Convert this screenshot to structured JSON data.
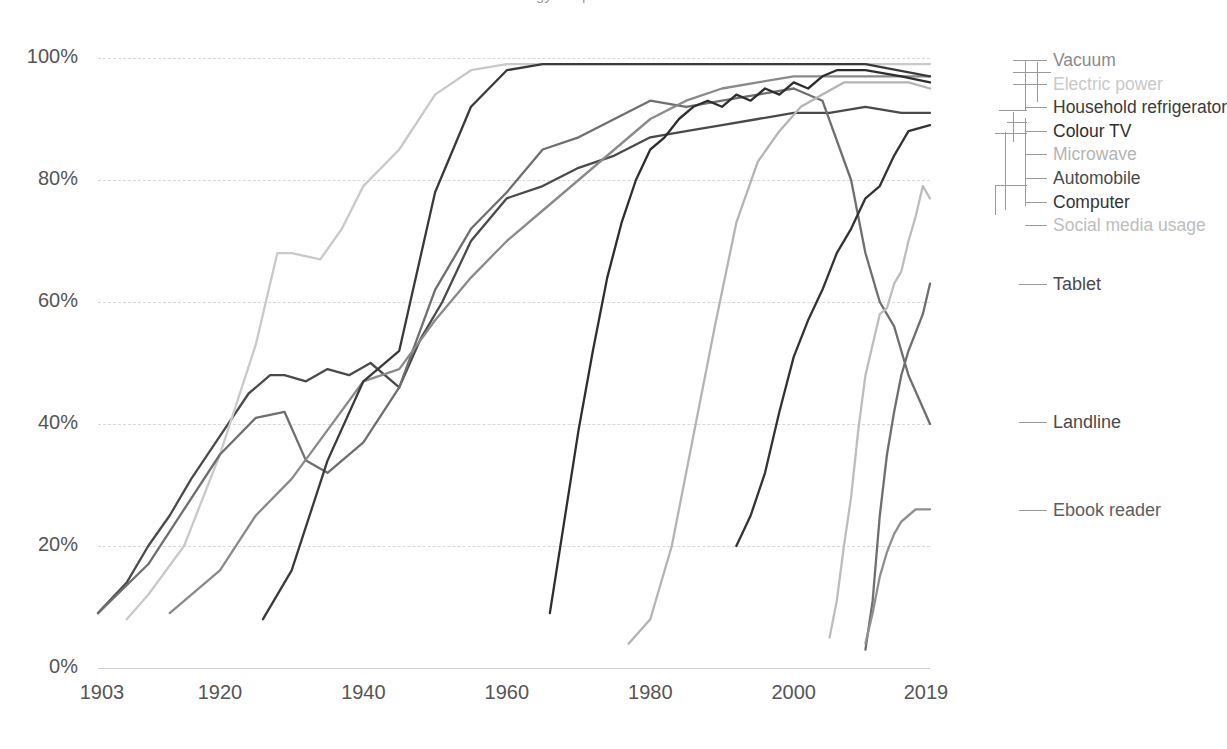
{
  "title": "Technology adoption in US households",
  "axes": {
    "y_ticks": [
      "100%",
      "80%",
      "60%",
      "40%",
      "20%",
      "0%"
    ],
    "y_values": [
      100,
      80,
      60,
      40,
      20,
      0
    ],
    "x_ticks": [
      "1903",
      "1920",
      "1940",
      "1960",
      "1980",
      "2000",
      "2019"
    ],
    "x_values": [
      1903,
      1920,
      1940,
      1960,
      1980,
      2000,
      2019
    ],
    "ylabel": "",
    "xlabel": ""
  },
  "legend": {
    "stacked": [
      {
        "label": "Vacuum",
        "color": "#8a8a8a"
      },
      {
        "label": "Electric power",
        "color": "#c9c9c9"
      },
      {
        "label": "Household refrigerator",
        "color": "#3a3a3a"
      },
      {
        "label": "Colour TV",
        "color": "#2e2e2e"
      },
      {
        "label": "Microwave",
        "color": "#b4b4b4"
      },
      {
        "label": "Automobile",
        "color": "#4a4a4a"
      },
      {
        "label": "Computer",
        "color": "#333333"
      },
      {
        "label": "Social media usage",
        "color": "#bdbdbd"
      }
    ],
    "floating": [
      {
        "label": "Tablet",
        "color": "#6f6f6f"
      },
      {
        "label": "Landline",
        "color": "#6f6f6f"
      },
      {
        "label": "Ebook reader",
        "color": "#8f8f8f"
      }
    ]
  },
  "chart_data": {
    "type": "line",
    "title": "Technology adoption in US households",
    "xlabel": "",
    "ylabel": "Share of US households (%)",
    "xlim": [
      1903,
      2019
    ],
    "ylim": [
      0,
      100
    ],
    "grid": "horizontal-dashed",
    "legend_position": "right-direct-labels",
    "series": [
      {
        "name": "Automobile",
        "color": "#4a4a4a",
        "points": [
          [
            1903,
            9
          ],
          [
            1907,
            14
          ],
          [
            1910,
            20
          ],
          [
            1913,
            25
          ],
          [
            1916,
            31
          ],
          [
            1920,
            38
          ],
          [
            1924,
            45
          ],
          [
            1927,
            48
          ],
          [
            1929,
            48
          ],
          [
            1932,
            47
          ],
          [
            1935,
            49
          ],
          [
            1938,
            48
          ],
          [
            1941,
            50
          ],
          [
            1945,
            46
          ],
          [
            1948,
            54
          ],
          [
            1951,
            60
          ],
          [
            1955,
            70
          ],
          [
            1960,
            77
          ],
          [
            1965,
            79
          ],
          [
            1970,
            82
          ],
          [
            1975,
            84
          ],
          [
            1980,
            87
          ],
          [
            1985,
            88
          ],
          [
            1990,
            89
          ],
          [
            1995,
            90
          ],
          [
            2000,
            91
          ],
          [
            2005,
            91
          ],
          [
            2010,
            92
          ],
          [
            2015,
            91
          ],
          [
            2019,
            91
          ]
        ]
      },
      {
        "name": "Electric power",
        "color": "#c9c9c9",
        "points": [
          [
            1907,
            8
          ],
          [
            1910,
            12
          ],
          [
            1915,
            20
          ],
          [
            1920,
            35
          ],
          [
            1925,
            53
          ],
          [
            1928,
            68
          ],
          [
            1930,
            68
          ],
          [
            1934,
            67
          ],
          [
            1937,
            72
          ],
          [
            1940,
            79
          ],
          [
            1945,
            85
          ],
          [
            1950,
            94
          ],
          [
            1955,
            98
          ],
          [
            1960,
            99
          ],
          [
            1970,
            99
          ],
          [
            1980,
            99
          ],
          [
            1990,
            99
          ],
          [
            2000,
            99
          ],
          [
            2010,
            99
          ],
          [
            2019,
            99
          ]
        ]
      },
      {
        "name": "Landline",
        "color": "#6f6f6f",
        "points": [
          [
            1903,
            9
          ],
          [
            1910,
            17
          ],
          [
            1915,
            26
          ],
          [
            1920,
            35
          ],
          [
            1925,
            41
          ],
          [
            1929,
            42
          ],
          [
            1932,
            34
          ],
          [
            1935,
            32
          ],
          [
            1940,
            37
          ],
          [
            1945,
            46
          ],
          [
            1950,
            62
          ],
          [
            1955,
            72
          ],
          [
            1960,
            78
          ],
          [
            1965,
            85
          ],
          [
            1970,
            87
          ],
          [
            1975,
            90
          ],
          [
            1980,
            93
          ],
          [
            1985,
            92
          ],
          [
            1990,
            93
          ],
          [
            1995,
            94
          ],
          [
            2000,
            95
          ],
          [
            2004,
            93
          ],
          [
            2008,
            80
          ],
          [
            2010,
            68
          ],
          [
            2012,
            60
          ],
          [
            2014,
            56
          ],
          [
            2016,
            48
          ],
          [
            2019,
            40
          ]
        ]
      },
      {
        "name": "Vacuum",
        "color": "#8a8a8a",
        "points": [
          [
            1913,
            9
          ],
          [
            1920,
            16
          ],
          [
            1925,
            25
          ],
          [
            1930,
            31
          ],
          [
            1935,
            39
          ],
          [
            1940,
            47
          ],
          [
            1945,
            49
          ],
          [
            1950,
            57
          ],
          [
            1955,
            64
          ],
          [
            1960,
            70
          ],
          [
            1965,
            75
          ],
          [
            1970,
            80
          ],
          [
            1975,
            85
          ],
          [
            1980,
            90
          ],
          [
            1985,
            93
          ],
          [
            1990,
            95
          ],
          [
            1995,
            96
          ],
          [
            2000,
            97
          ],
          [
            2005,
            97
          ],
          [
            2010,
            97
          ],
          [
            2015,
            97
          ],
          [
            2019,
            97
          ]
        ]
      },
      {
        "name": "Household refrigerator",
        "color": "#3a3a3a",
        "points": [
          [
            1926,
            8
          ],
          [
            1930,
            16
          ],
          [
            1935,
            34
          ],
          [
            1940,
            47
          ],
          [
            1945,
            52
          ],
          [
            1950,
            78
          ],
          [
            1955,
            92
          ],
          [
            1960,
            98
          ],
          [
            1965,
            99
          ],
          [
            1970,
            99
          ],
          [
            1980,
            99
          ],
          [
            1990,
            99
          ],
          [
            2000,
            99
          ],
          [
            2010,
            99
          ],
          [
            2019,
            97
          ]
        ]
      },
      {
        "name": "Colour TV",
        "color": "#2e2e2e",
        "points": [
          [
            1966,
            9
          ],
          [
            1968,
            24
          ],
          [
            1970,
            39
          ],
          [
            1972,
            52
          ],
          [
            1974,
            64
          ],
          [
            1976,
            73
          ],
          [
            1978,
            80
          ],
          [
            1980,
            85
          ],
          [
            1982,
            87
          ],
          [
            1984,
            90
          ],
          [
            1986,
            92
          ],
          [
            1988,
            93
          ],
          [
            1990,
            92
          ],
          [
            1992,
            94
          ],
          [
            1994,
            93
          ],
          [
            1996,
            95
          ],
          [
            1998,
            94
          ],
          [
            2000,
            96
          ],
          [
            2002,
            95
          ],
          [
            2004,
            97
          ],
          [
            2006,
            98
          ],
          [
            2010,
            98
          ],
          [
            2015,
            97
          ],
          [
            2019,
            96
          ]
        ]
      },
      {
        "name": "Microwave",
        "color": "#b4b4b4",
        "points": [
          [
            1977,
            4
          ],
          [
            1980,
            8
          ],
          [
            1983,
            20
          ],
          [
            1986,
            38
          ],
          [
            1989,
            56
          ],
          [
            1992,
            73
          ],
          [
            1995,
            83
          ],
          [
            1998,
            88
          ],
          [
            2001,
            92
          ],
          [
            2004,
            94
          ],
          [
            2007,
            96
          ],
          [
            2010,
            96
          ],
          [
            2013,
            96
          ],
          [
            2016,
            96
          ],
          [
            2019,
            95
          ]
        ]
      },
      {
        "name": "Computer",
        "color": "#333333",
        "points": [
          [
            1992,
            20
          ],
          [
            1994,
            25
          ],
          [
            1996,
            32
          ],
          [
            1998,
            42
          ],
          [
            2000,
            51
          ],
          [
            2002,
            57
          ],
          [
            2004,
            62
          ],
          [
            2006,
            68
          ],
          [
            2008,
            72
          ],
          [
            2010,
            77
          ],
          [
            2012,
            79
          ],
          [
            2014,
            84
          ],
          [
            2016,
            88
          ],
          [
            2019,
            89
          ]
        ]
      },
      {
        "name": "Social media usage",
        "color": "#bdbdbd",
        "points": [
          [
            2005,
            5
          ],
          [
            2006,
            11
          ],
          [
            2007,
            20
          ],
          [
            2008,
            28
          ],
          [
            2009,
            39
          ],
          [
            2010,
            48
          ],
          [
            2011,
            53
          ],
          [
            2012,
            58
          ],
          [
            2013,
            59
          ],
          [
            2014,
            63
          ],
          [
            2015,
            65
          ],
          [
            2016,
            70
          ],
          [
            2017,
            74
          ],
          [
            2018,
            79
          ],
          [
            2019,
            77
          ]
        ]
      },
      {
        "name": "Tablet",
        "color": "#6f6f6f",
        "points": [
          [
            2010,
            3
          ],
          [
            2011,
            11
          ],
          [
            2012,
            25
          ],
          [
            2013,
            35
          ],
          [
            2014,
            42
          ],
          [
            2015,
            48
          ],
          [
            2016,
            52
          ],
          [
            2017,
            55
          ],
          [
            2018,
            58
          ],
          [
            2019,
            63
          ]
        ]
      },
      {
        "name": "Ebook reader",
        "color": "#8f8f8f",
        "points": [
          [
            2010,
            4
          ],
          [
            2011,
            9
          ],
          [
            2012,
            15
          ],
          [
            2013,
            19
          ],
          [
            2014,
            22
          ],
          [
            2015,
            24
          ],
          [
            2016,
            25
          ],
          [
            2017,
            26
          ],
          [
            2018,
            26
          ],
          [
            2019,
            26
          ]
        ]
      }
    ]
  }
}
